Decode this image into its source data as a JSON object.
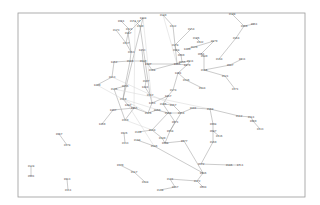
{
  "diagram": {
    "type": "network-graph",
    "frame": {
      "x": 18,
      "y": 13,
      "w": 287,
      "h": 184,
      "stroke": "#9a9a9a"
    },
    "edge_color": "#8a8a8a",
    "label_color": "#333333",
    "nodes": [
      {
        "id": "n1",
        "label": "1961",
        "x": 121,
        "y": 21
      },
      {
        "id": "n2",
        "label": "2151.37",
        "x": 135,
        "y": 21
      },
      {
        "id": "n3",
        "label": "1488",
        "x": 143,
        "y": 18
      },
      {
        "id": "n4",
        "label": "2140",
        "x": 140,
        "y": 26
      },
      {
        "id": "n5",
        "label": "2173",
        "x": 116,
        "y": 30
      },
      {
        "id": "n6",
        "label": "2122",
        "x": 129,
        "y": 29
      },
      {
        "id": "n7",
        "label": "2187",
        "x": 128,
        "y": 33
      },
      {
        "id": "n8",
        "label": "2137",
        "x": 126,
        "y": 43
      },
      {
        "id": "n9",
        "label": "2163",
        "x": 131,
        "y": 52
      },
      {
        "id": "n10",
        "label": "1453",
        "x": 142,
        "y": 50
      },
      {
        "id": "n11",
        "label": "1452",
        "x": 114,
        "y": 62
      },
      {
        "id": "n12",
        "label": "2183",
        "x": 130,
        "y": 61
      },
      {
        "id": "n13",
        "label": "2130",
        "x": 143,
        "y": 61
      },
      {
        "id": "n14",
        "label": "1447",
        "x": 148,
        "y": 64
      },
      {
        "id": "n15",
        "label": "2113",
        "x": 112,
        "y": 77
      },
      {
        "id": "n16",
        "label": "1449",
        "x": 97,
        "y": 85
      },
      {
        "id": "n17",
        "label": "2156",
        "x": 125,
        "y": 86
      },
      {
        "id": "n18",
        "label": "2107",
        "x": 146,
        "y": 81
      },
      {
        "id": "n19",
        "label": "2168",
        "x": 152,
        "y": 70
      },
      {
        "id": "n20",
        "label": "2135",
        "x": 114,
        "y": 89
      },
      {
        "id": "n21",
        "label": "2119",
        "x": 123,
        "y": 99
      },
      {
        "id": "n22",
        "label": "2117",
        "x": 150,
        "y": 95
      },
      {
        "id": "n23",
        "label": "1481",
        "x": 145,
        "y": 87
      },
      {
        "id": "n24",
        "label": "2180",
        "x": 163,
        "y": 15
      },
      {
        "id": "n25",
        "label": "2132",
        "x": 173,
        "y": 26
      },
      {
        "id": "n26",
        "label": "2154",
        "x": 191,
        "y": 29
      },
      {
        "id": "n27",
        "label": "2106",
        "x": 196,
        "y": 38
      },
      {
        "id": "n28",
        "label": "2142",
        "x": 200,
        "y": 42
      },
      {
        "id": "n29",
        "label": "2178",
        "x": 175,
        "y": 45
      },
      {
        "id": "n30",
        "label": "2168",
        "x": 176,
        "y": 50
      },
      {
        "id": "n31",
        "label": "1449",
        "x": 187,
        "y": 49
      },
      {
        "id": "n32",
        "label": "2069",
        "x": 181,
        "y": 55
      },
      {
        "id": "n33",
        "label": "2120",
        "x": 194,
        "y": 47
      },
      {
        "id": "n34",
        "label": "2179",
        "x": 214,
        "y": 41
      },
      {
        "id": "n35",
        "label": "2148",
        "x": 232,
        "y": 14
      },
      {
        "id": "n36",
        "label": "2169",
        "x": 244,
        "y": 26
      },
      {
        "id": "n37",
        "label": "1961",
        "x": 254,
        "y": 24
      },
      {
        "id": "n38",
        "label": "2164",
        "x": 236,
        "y": 38
      },
      {
        "id": "n39",
        "label": "2051",
        "x": 201,
        "y": 54
      },
      {
        "id": "n40",
        "label": "2189",
        "x": 204,
        "y": 56
      },
      {
        "id": "n41",
        "label": "2144",
        "x": 219,
        "y": 59
      },
      {
        "id": "n42",
        "label": "2155",
        "x": 182,
        "y": 62
      },
      {
        "id": "n43",
        "label": "2131",
        "x": 190,
        "y": 61
      },
      {
        "id": "n44",
        "label": "1465",
        "x": 177,
        "y": 64
      },
      {
        "id": "n45",
        "label": "1479",
        "x": 187,
        "y": 65
      },
      {
        "id": "n46",
        "label": "2116",
        "x": 204,
        "y": 70
      },
      {
        "id": "n47",
        "label": "2087",
        "x": 230,
        "y": 65
      },
      {
        "id": "n48",
        "label": "1931",
        "x": 242,
        "y": 59
      },
      {
        "id": "n49",
        "label": "2121",
        "x": 225,
        "y": 76
      },
      {
        "id": "n50",
        "label": "2171",
        "x": 235,
        "y": 89
      },
      {
        "id": "n51",
        "label": "1401",
        "x": 178,
        "y": 73
      },
      {
        "id": "n52",
        "label": "2136",
        "x": 186,
        "y": 80
      },
      {
        "id": "n53",
        "label": "2184",
        "x": 202,
        "y": 88
      },
      {
        "id": "n54",
        "label": "2174",
        "x": 173,
        "y": 90
      },
      {
        "id": "n55",
        "label": "1467",
        "x": 168,
        "y": 96
      },
      {
        "id": "n56",
        "label": "1453",
        "x": 152,
        "y": 103
      },
      {
        "id": "n57",
        "label": "2145",
        "x": 163,
        "y": 104
      },
      {
        "id": "n58",
        "label": "2157",
        "x": 173,
        "y": 105
      },
      {
        "id": "n59",
        "label": "1487",
        "x": 128,
        "y": 105
      },
      {
        "id": "n60",
        "label": "1407",
        "x": 113,
        "y": 110
      },
      {
        "id": "n61",
        "label": "1469",
        "x": 102,
        "y": 124
      },
      {
        "id": "n62",
        "label": "2120",
        "x": 125,
        "y": 120
      },
      {
        "id": "n63",
        "label": "1465",
        "x": 134,
        "y": 108
      },
      {
        "id": "n64",
        "label": "2126",
        "x": 148,
        "y": 113
      },
      {
        "id": "n65",
        "label": "2160",
        "x": 157,
        "y": 110
      },
      {
        "id": "n66",
        "label": "2168",
        "x": 168,
        "y": 113
      },
      {
        "id": "n67",
        "label": "2154",
        "x": 181,
        "y": 113
      },
      {
        "id": "n68",
        "label": "2181",
        "x": 193,
        "y": 108
      },
      {
        "id": "n69",
        "label": "2168",
        "x": 210,
        "y": 109
      },
      {
        "id": "n70",
        "label": "1998",
        "x": 213,
        "y": 124
      },
      {
        "id": "n71",
        "label": "2112",
        "x": 239,
        "y": 116
      },
      {
        "id": "n72",
        "label": "2111",
        "x": 251,
        "y": 117
      },
      {
        "id": "n73",
        "label": "1960",
        "x": 253,
        "y": 121
      },
      {
        "id": "n74",
        "label": "2133",
        "x": 260,
        "y": 129
      },
      {
        "id": "n75",
        "label": "2087",
        "x": 213,
        "y": 131
      },
      {
        "id": "n76",
        "label": "2136",
        "x": 219,
        "y": 136
      },
      {
        "id": "n77",
        "label": "2160",
        "x": 213,
        "y": 142
      },
      {
        "id": "n78",
        "label": "2071",
        "x": 175,
        "y": 122
      },
      {
        "id": "n79",
        "label": "1938",
        "x": 170,
        "y": 131
      },
      {
        "id": "n80",
        "label": "2134",
        "x": 152,
        "y": 130
      },
      {
        "id": "n81",
        "label": "2149",
        "x": 162,
        "y": 138
      },
      {
        "id": "n82",
        "label": "1998",
        "x": 165,
        "y": 143
      },
      {
        "id": "n83",
        "label": "2144",
        "x": 137,
        "y": 140
      },
      {
        "id": "n84",
        "label": "2139",
        "x": 138,
        "y": 132
      },
      {
        "id": "n85",
        "label": "2186",
        "x": 154,
        "y": 146
      },
      {
        "id": "n86",
        "label": "1977",
        "x": 184,
        "y": 141
      },
      {
        "id": "n87",
        "label": "2072",
        "x": 201,
        "y": 164
      },
      {
        "id": "n88",
        "label": "2186",
        "x": 229,
        "y": 165
      },
      {
        "id": "n89",
        "label": "1711",
        "x": 240,
        "y": 165
      },
      {
        "id": "n90",
        "label": "1986",
        "x": 203,
        "y": 173
      },
      {
        "id": "n91",
        "label": "2172",
        "x": 197,
        "y": 181
      },
      {
        "id": "n92",
        "label": "2094",
        "x": 203,
        "y": 187
      },
      {
        "id": "n93",
        "label": "2131",
        "x": 170,
        "y": 179
      },
      {
        "id": "n94",
        "label": "2167",
        "x": 175,
        "y": 187
      },
      {
        "id": "n95",
        "label": "2138",
        "x": 160,
        "y": 190
      },
      {
        "id": "n96",
        "label": "1979",
        "x": 120,
        "y": 165
      },
      {
        "id": "n97",
        "label": "2117",
        "x": 134,
        "y": 172
      },
      {
        "id": "n98",
        "label": "2188",
        "x": 145,
        "y": 182
      },
      {
        "id": "n99",
        "label": "1967",
        "x": 59,
        "y": 134
      },
      {
        "id": "n100",
        "label": "2178",
        "x": 67,
        "y": 145
      },
      {
        "id": "n101",
        "label": "2128",
        "x": 31,
        "y": 166
      },
      {
        "id": "n102",
        "label": "2901",
        "x": 31,
        "y": 176
      },
      {
        "id": "n103",
        "label": "1913",
        "x": 67,
        "y": 179
      },
      {
        "id": "n104",
        "label": "2111",
        "x": 68,
        "y": 190
      },
      {
        "id": "n105",
        "label": "2133",
        "x": 125,
        "y": 143
      },
      {
        "id": "n106",
        "label": "1926",
        "x": 124,
        "y": 133
      }
    ],
    "edges": [
      [
        "n1",
        "n6"
      ],
      [
        "n2",
        "n4"
      ],
      [
        "n3",
        "n7"
      ],
      [
        "n5",
        "n8"
      ],
      [
        "n6",
        "n8"
      ],
      [
        "n7",
        "n9"
      ],
      [
        "n8",
        "n9"
      ],
      [
        "n3",
        "n21"
      ],
      [
        "n4",
        "n22"
      ],
      [
        "n9",
        "n12"
      ],
      [
        "n10",
        "n13"
      ],
      [
        "n12",
        "n13"
      ],
      [
        "n11",
        "n12"
      ],
      [
        "n11",
        "n15"
      ],
      [
        "n15",
        "n16"
      ],
      [
        "n13",
        "n14"
      ],
      [
        "n14",
        "n19"
      ],
      [
        "n12",
        "n17"
      ],
      [
        "n17",
        "n20"
      ],
      [
        "n17",
        "n21"
      ],
      [
        "n13",
        "n18"
      ],
      [
        "n18",
        "n23"
      ],
      [
        "n23",
        "n22"
      ],
      [
        "n24",
        "n25"
      ],
      [
        "n25",
        "n29"
      ],
      [
        "n26",
        "n29"
      ],
      [
        "n29",
        "n30"
      ],
      [
        "n30",
        "n32"
      ],
      [
        "n31",
        "n33"
      ],
      [
        "n33",
        "n34"
      ],
      [
        "n27",
        "n28"
      ],
      [
        "n35",
        "n36"
      ],
      [
        "n36",
        "n37"
      ],
      [
        "n36",
        "n38"
      ],
      [
        "n38",
        "n41"
      ],
      [
        "n32",
        "n42"
      ],
      [
        "n42",
        "n43"
      ],
      [
        "n43",
        "n45"
      ],
      [
        "n44",
        "n45"
      ],
      [
        "n39",
        "n40"
      ],
      [
        "n40",
        "n46"
      ],
      [
        "n46",
        "n47"
      ],
      [
        "n47",
        "n48"
      ],
      [
        "n46",
        "n49"
      ],
      [
        "n49",
        "n50"
      ],
      [
        "n45",
        "n51"
      ],
      [
        "n51",
        "n52"
      ],
      [
        "n52",
        "n53"
      ],
      [
        "n51",
        "n54"
      ],
      [
        "n54",
        "n55"
      ],
      [
        "n55",
        "n56"
      ],
      [
        "n55",
        "n57"
      ],
      [
        "n57",
        "n58"
      ],
      [
        "n14",
        "n44"
      ],
      [
        "n19",
        "n42"
      ],
      [
        "n22",
        "n56"
      ],
      [
        "n56",
        "n64"
      ],
      [
        "n59",
        "n63"
      ],
      [
        "n60",
        "n63"
      ],
      [
        "n60",
        "n61"
      ],
      [
        "n62",
        "n63"
      ],
      [
        "n63",
        "n64"
      ],
      [
        "n64",
        "n65"
      ],
      [
        "n65",
        "n66"
      ],
      [
        "n66",
        "n67"
      ],
      [
        "n67",
        "n68"
      ],
      [
        "n68",
        "n69"
      ],
      [
        "n69",
        "n71"
      ],
      [
        "n71",
        "n72"
      ],
      [
        "n72",
        "n73"
      ],
      [
        "n73",
        "n74"
      ],
      [
        "n69",
        "n70"
      ],
      [
        "n70",
        "n75"
      ],
      [
        "n75",
        "n76"
      ],
      [
        "n75",
        "n77"
      ],
      [
        "n77",
        "n87"
      ],
      [
        "n87",
        "n88"
      ],
      [
        "n88",
        "n89"
      ],
      [
        "n78",
        "n79"
      ],
      [
        "n79",
        "n82"
      ],
      [
        "n80",
        "n81"
      ],
      [
        "n81",
        "n82"
      ],
      [
        "n80",
        "n84"
      ],
      [
        "n83",
        "n85"
      ],
      [
        "n85",
        "n90"
      ],
      [
        "n86",
        "n90"
      ],
      [
        "n90",
        "n91"
      ],
      [
        "n91",
        "n92"
      ],
      [
        "n91",
        "n93"
      ],
      [
        "n93",
        "n94"
      ],
      [
        "n94",
        "n95"
      ],
      [
        "n96",
        "n97"
      ],
      [
        "n97",
        "n98"
      ],
      [
        "n99",
        "n100"
      ],
      [
        "n101",
        "n102"
      ],
      [
        "n103",
        "n104"
      ],
      [
        "n57",
        "n78"
      ],
      [
        "n58",
        "n67"
      ],
      [
        "n106",
        "n105"
      ],
      [
        "n21",
        "n59"
      ],
      [
        "n20",
        "n62"
      ],
      [
        "n29",
        "n44"
      ],
      [
        "n34",
        "n39"
      ],
      [
        "n66",
        "n80"
      ],
      [
        "n82",
        "n86"
      ],
      [
        "n67",
        "n79"
      ]
    ],
    "light_edges": [
      [
        "n3",
        "n56"
      ],
      [
        "n2",
        "n63"
      ],
      [
        "n16",
        "n64"
      ],
      [
        "n21",
        "n66"
      ],
      [
        "n24",
        "n44"
      ],
      [
        "n20",
        "n69"
      ],
      [
        "n62",
        "n80"
      ],
      [
        "n59",
        "n85"
      ],
      [
        "n15",
        "n58"
      ]
    ]
  }
}
